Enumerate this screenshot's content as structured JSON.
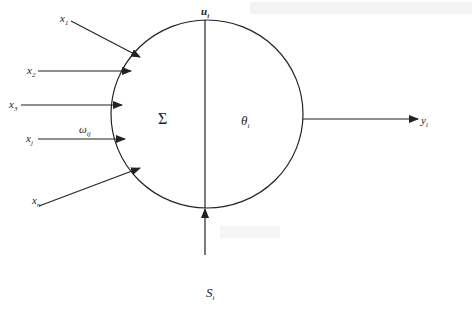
{
  "diagram": {
    "type": "artificial-neuron-model",
    "inputs": [
      {
        "symbol": "x",
        "sub": "1"
      },
      {
        "symbol": "x",
        "sub": "2"
      },
      {
        "symbol": "x",
        "sub": "3"
      },
      {
        "symbol": "x",
        "sub": "j"
      },
      {
        "symbol": "x",
        "sub": "n"
      }
    ],
    "weight": {
      "symbol": "ω",
      "sub": "ij"
    },
    "summation": "Σ",
    "threshold": {
      "symbol": "θ",
      "sub": "i"
    },
    "state": {
      "symbol": "u",
      "sub": "i"
    },
    "external_input": {
      "symbol": "S",
      "sub": "i"
    },
    "output": {
      "symbol": "y",
      "sub": "i"
    },
    "colors": {
      "line": "#222222",
      "background": "#ffffff"
    }
  }
}
